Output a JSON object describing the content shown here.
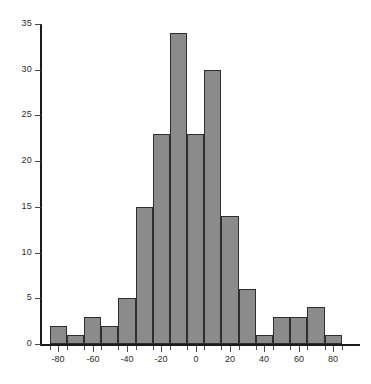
{
  "chart_data": {
    "type": "bar",
    "title": "",
    "subtitle": "",
    "xlabel": "",
    "ylabel": "",
    "grid": false,
    "legend": "none",
    "bin_width": 10,
    "bin_starts": [
      -85,
      -75,
      -65,
      -55,
      -45,
      -35,
      -25,
      -15,
      -5,
      5,
      15,
      25,
      35,
      45,
      55,
      65,
      75,
      85
    ],
    "categories": [
      "-85",
      "-75",
      "-65",
      "-55",
      "-45",
      "-35",
      "-25",
      "-15",
      "-5",
      "5",
      "15",
      "25",
      "35",
      "45",
      "55",
      "65",
      "75",
      "85"
    ],
    "values": [
      2,
      1,
      3,
      2,
      5,
      15,
      23,
      34,
      23,
      30,
      14,
      6,
      1,
      3,
      3,
      4,
      1,
      0
    ],
    "xlim": [
      -90,
      95
    ],
    "ylim": [
      0,
      35
    ],
    "xticks": [
      -80,
      -60,
      -40,
      -20,
      0,
      20,
      40,
      60,
      80
    ],
    "xtick_labels": [
      "-80",
      "-60",
      "-40",
      "-20",
      "0",
      "20",
      "40",
      "60",
      "80"
    ],
    "yticks": [
      0,
      5,
      10,
      15,
      20,
      25,
      30,
      35
    ],
    "ytick_labels": [
      "0",
      "5",
      "10",
      "15",
      "20",
      "25",
      "30",
      "35"
    ],
    "bar_fill_color": "#8b8b8b",
    "bar_edge_color": "#2e2e2e",
    "axis_color": "#1b1b1b",
    "background_color": "#ffffff"
  }
}
